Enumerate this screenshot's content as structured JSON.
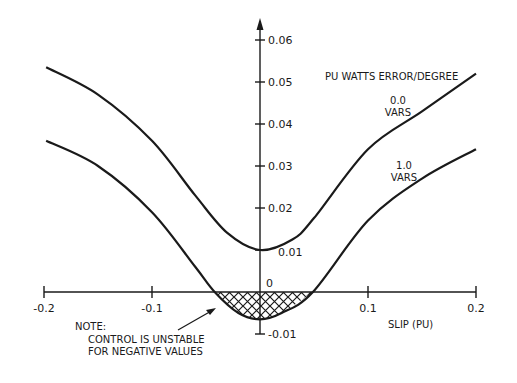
{
  "chart_data": {
    "type": "line",
    "title": "",
    "ylabel": "PU WATTS ERROR/DEGREE",
    "xlabel": "SLIP (PU)",
    "xlim": [
      -0.2,
      0.2
    ],
    "ylim": [
      -0.01,
      0.06
    ],
    "grid": false,
    "x_ticks": [
      -0.2,
      -0.1,
      0.1,
      0.2
    ],
    "x_tick_labels": [
      "-0.2",
      "-0.1",
      "0.1",
      "0.2"
    ],
    "y_ticks": [
      0.06,
      0.05,
      0.04,
      0.03,
      0.02,
      0.01,
      0,
      -0.01
    ],
    "y_tick_labels": [
      "0.06",
      "0.05",
      "0.04",
      "0.03",
      "0.02",
      "0.01",
      "0",
      "-0.01"
    ],
    "series": [
      {
        "name": "0.0 VARS",
        "label_lines": [
          "0.0",
          "VARS"
        ],
        "x": [
          -0.198,
          -0.15,
          -0.1,
          -0.06,
          -0.03,
          0.0,
          0.03,
          0.05,
          0.1,
          0.15,
          0.2
        ],
        "y": [
          0.0535,
          0.047,
          0.036,
          0.023,
          0.014,
          0.01,
          0.0125,
          0.0176,
          0.034,
          0.043,
          0.052
        ]
      },
      {
        "name": "1.0 VARS",
        "label_lines": [
          "1.0",
          "VARS"
        ],
        "x": [
          -0.198,
          -0.15,
          -0.1,
          -0.06,
          -0.042,
          -0.02,
          0.0,
          0.02,
          0.049,
          0.1,
          0.15,
          0.2
        ],
        "y": [
          0.036,
          0.03,
          0.019,
          0.006,
          0.0,
          -0.005,
          -0.0065,
          -0.005,
          0.0,
          0.017,
          0.027,
          0.034
        ]
      }
    ],
    "annotations": {
      "note_title": "NOTE:",
      "note_line1": "CONTROL IS UNSTABLE",
      "note_line2": "FOR NEGATIVE VALUES",
      "hatched_region": "negative values of 1.0 VARS curve between slip -0.042 and 0.049"
    }
  }
}
